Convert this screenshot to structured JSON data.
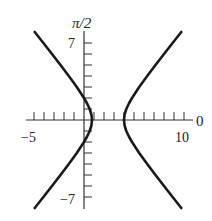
{
  "chart_data": {
    "type": "line",
    "title": "",
    "subtitle": "",
    "xlabel": "0",
    "ylabel": "π/2",
    "xlim": [
      -5,
      10.9
    ],
    "ylim": [
      -8.1,
      8.1
    ],
    "grid": false,
    "legend": null,
    "equation": "r = 2/(1 + 1.5 cos θ) (polar hyperbola, focus at pole)",
    "x_ticks": [
      -5,
      -4,
      -3,
      -2,
      -1,
      0,
      1,
      2,
      3,
      4,
      5,
      6,
      7,
      8,
      9,
      10
    ],
    "y_ticks": [
      -7,
      -6,
      -5,
      -4,
      -3,
      -2,
      -1,
      0,
      1,
      2,
      3,
      4,
      5,
      6,
      7
    ],
    "x_tick_labels": [
      {
        "value": -5,
        "text": "−5"
      },
      {
        "value": 10,
        "text": "10"
      }
    ],
    "y_tick_labels": [
      {
        "value": 7,
        "text": "7"
      },
      {
        "value": -7,
        "text": "−7"
      }
    ],
    "axis_labels": {
      "polar_axis": "0",
      "vertical_axis": "π/2"
    },
    "series": [
      {
        "name": "left-branch",
        "points": [
          [
            -4.932,
            8
          ],
          [
            -4.062,
            7
          ],
          [
            -3.2,
            6
          ],
          [
            -2.35,
            5
          ],
          [
            -1.519,
            4
          ],
          [
            -0.724,
            3
          ],
          [
            0.0,
            2
          ],
          [
            0.312,
            1.5
          ],
          [
            0.567,
            1
          ],
          [
            0.739,
            0.5
          ],
          [
            0.8,
            0
          ],
          [
            0.739,
            -0.5
          ],
          [
            0.567,
            -1
          ],
          [
            0.312,
            -1.5
          ],
          [
            0.0,
            -2
          ],
          [
            -0.724,
            -3
          ],
          [
            -1.519,
            -4
          ],
          [
            -2.35,
            -5
          ],
          [
            -3.2,
            -6
          ],
          [
            -4.062,
            -7
          ],
          [
            -4.932,
            -8
          ]
        ]
      },
      {
        "name": "right-branch",
        "points": [
          [
            9.732,
            8
          ],
          [
            8.862,
            7
          ],
          [
            8.0,
            6
          ],
          [
            7.15,
            5
          ],
          [
            6.319,
            4
          ],
          [
            5.524,
            3
          ],
          [
            4.8,
            2
          ],
          [
            4.488,
            1.5
          ],
          [
            4.233,
            1
          ],
          [
            4.061,
            0.5
          ],
          [
            4.0,
            0
          ],
          [
            4.061,
            -0.5
          ],
          [
            4.233,
            -1
          ],
          [
            4.488,
            -1.5
          ],
          [
            4.8,
            -2
          ],
          [
            5.524,
            -3
          ],
          [
            6.319,
            -4
          ],
          [
            7.15,
            -5
          ],
          [
            8.0,
            -6
          ],
          [
            8.862,
            -7
          ],
          [
            9.732,
            -8
          ]
        ]
      }
    ],
    "colors": {
      "curve": "#1a1a1a",
      "axis": "#333333"
    }
  }
}
